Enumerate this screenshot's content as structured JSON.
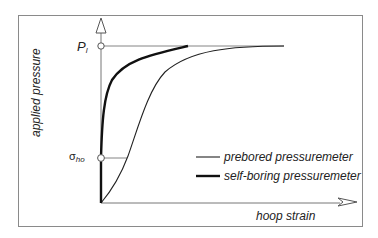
{
  "figure": {
    "y_axis_label": "applied pressure",
    "x_axis_label": "hoop strain",
    "tick_pl_main": "P",
    "tick_pl_sub": "l",
    "tick_sigma_main": "σ",
    "tick_sigma_sub": "ho",
    "legend": [
      {
        "label": "prebored pressuremeter",
        "style": "thin"
      },
      {
        "label": "self-boring pressuremeter",
        "style": "thick"
      }
    ],
    "colors": {
      "line": "#222222",
      "frame": "#8a8a8a",
      "axis": "#666666"
    }
  }
}
